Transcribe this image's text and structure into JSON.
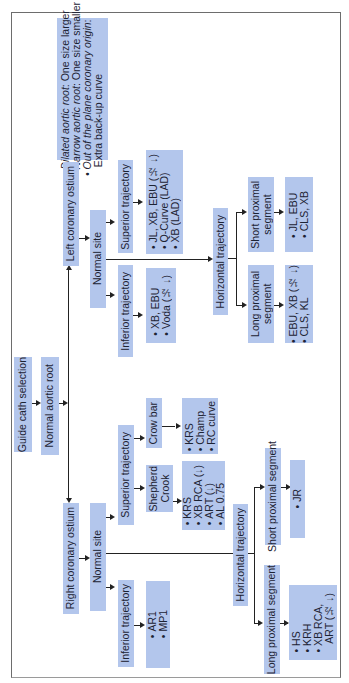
{
  "diagram": {
    "root": "Guide cath selection",
    "aortic_root": "Normal aortic root",
    "notes": [
      {
        "label": "Dilated aortic root",
        "text": ": One size larger"
      },
      {
        "label": "Narrow aortic root",
        "text": ": One size smaller"
      },
      {
        "label": "Out of the plane coronary origin",
        "text": ":"
      },
      {
        "label": "",
        "text": "Extra back-up curve"
      }
    ],
    "left": {
      "ostium": "Left coronary ostium",
      "site": "Normal site",
      "superior": {
        "label": "Superior trajectory",
        "caths": [
          "JL, XB, EBU (½ ↓)",
          "Q-Curve (LAD)",
          "XB (LAD)"
        ]
      },
      "inferior": {
        "label": "Inferior trajectory",
        "caths": [
          "XB, EBU",
          "Voda (½ ↓)"
        ]
      },
      "horizontal": {
        "label": "Horizontal trajectory",
        "short": {
          "label_line1": "Short proximal",
          "label_line2": "segment",
          "caths": [
            "JL, EBU",
            "CLS, XB"
          ]
        },
        "long": {
          "label_line1": "Long proximal",
          "label_line2": "segment",
          "caths": [
            "EBU, XB (½ ↓)",
            "CLS, KL"
          ]
        }
      }
    },
    "right": {
      "ostium": "Right coronary ostium",
      "site": "Normal site",
      "superior": {
        "label": "Superior trajectory",
        "shepherd": {
          "label_line1": "Shepherd",
          "label_line2": "Crook",
          "caths": [
            "KRS",
            "XB RCA (↓)",
            "ART (↓)",
            "AL 0.75"
          ]
        },
        "crowbar": {
          "label": "Crow bar",
          "caths": [
            "KRS",
            "Champ",
            "RC curve"
          ]
        }
      },
      "inferior": {
        "label": "Inferior trajectory",
        "caths": [
          "AR1",
          "MP1"
        ]
      },
      "horizontal": {
        "label": "Horizontal trajectory",
        "short": {
          "label": "Short proximal segment",
          "caths": [
            "JR"
          ]
        },
        "long": {
          "label": "Long proximal segment",
          "caths": [
            "HS",
            "KRH",
            "XB RCA,",
            "ART (½ ↓)"
          ]
        }
      }
    },
    "colors": {
      "box_fill": "#b3c6ec",
      "line": "#222222",
      "text": "#1d2333",
      "frame": "#6d6d6d"
    }
  }
}
